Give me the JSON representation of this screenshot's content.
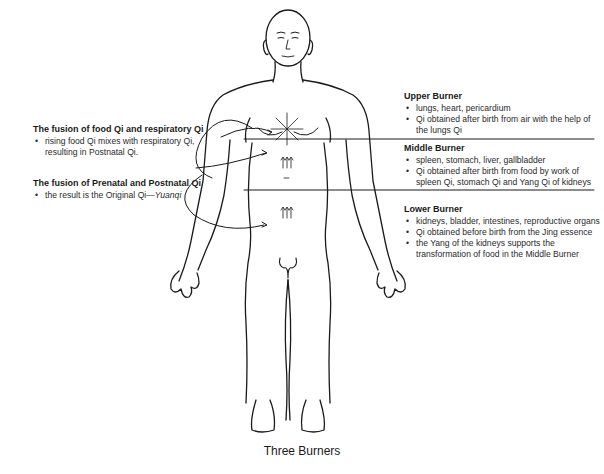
{
  "figure": {
    "caption": "Three Burners",
    "upper_burner": {
      "title": "Upper Burner",
      "items": [
        "lungs, heart, pericardium",
        "Qi obtained after birth from air with the help of the lungs Qi"
      ]
    },
    "middle_burner": {
      "title": "Middle Burner",
      "items": [
        "spleen, stomach, liver, gallbladder",
        "Qi obtained after birth from food by work of spleen Qi, stomach Qi and Yang Qi of kidneys"
      ]
    },
    "lower_burner": {
      "title": "Lower Burner",
      "items": [
        "kidneys, bladder, intestines, reproductive organs",
        "Qi obtained before birth from the Jing essence",
        "the Yang of the kidneys supports the transformation of food in the Middle Burner"
      ]
    },
    "fusion_food_respiratory": {
      "title": "The fusion of food Qi and respiratory Qi",
      "items": [
        "rising food Qi mixes with respiratory Qi, resulting in Postnatal Qi."
      ]
    },
    "fusion_prenatal_postnatal": {
      "title": "The fusion of Prenatal and Postnatal Qi",
      "item_prefix": "the result is the Original Qi—",
      "item_italic": "Yuanqi"
    },
    "colors": {
      "ink": "#1a1a1a",
      "background": "#ffffff"
    }
  }
}
